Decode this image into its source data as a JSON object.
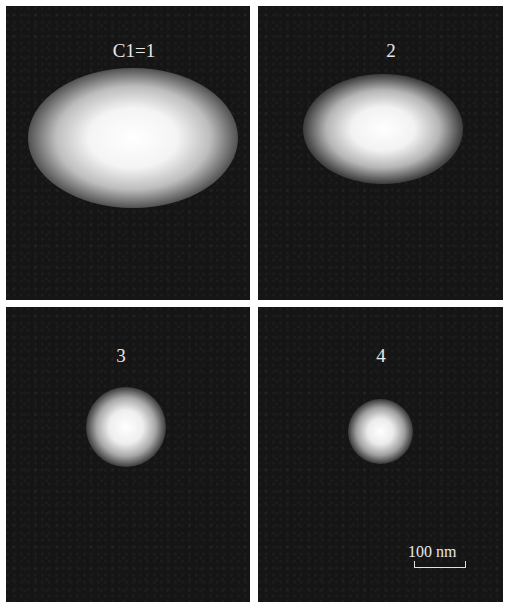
{
  "figure": {
    "panels": [
      {
        "id": "1",
        "label": "C1=1",
        "spot": "large elliptical bright spot"
      },
      {
        "id": "2",
        "label": "2",
        "spot": "medium elliptical bright spot"
      },
      {
        "id": "3",
        "label": "3",
        "spot": "small round bright spot"
      },
      {
        "id": "4",
        "label": "4",
        "spot": "smallest round bright spot"
      }
    ],
    "scale_bar": {
      "label": "100 nm"
    },
    "colors": {
      "background": "#151515",
      "spot": "#ffffff",
      "gutter": "#ffffff"
    }
  }
}
